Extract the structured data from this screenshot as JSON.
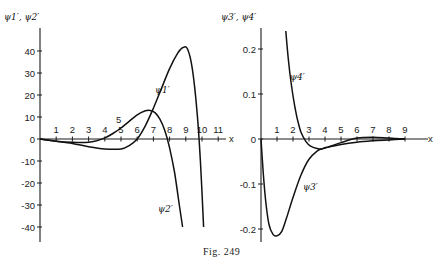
{
  "caption": "Fig. 249",
  "chart_data": [
    {
      "type": "line",
      "title": "",
      "ylabel": "ψ1′, ψ2′",
      "xlabel": "x",
      "xlim": [
        0,
        11
      ],
      "ylim": [
        -45,
        45
      ],
      "x_ticks": [
        1,
        2,
        3,
        4,
        5,
        6,
        7,
        8,
        9,
        10,
        11
      ],
      "x_tick_labels": [
        "1",
        "2",
        "3",
        "4",
        "5",
        "6",
        "7",
        "8",
        "9",
        "10",
        "11"
      ],
      "y_ticks": [
        -40,
        -30,
        -20,
        -10,
        0,
        10,
        20,
        30,
        40
      ],
      "y_tick_labels": [
        "-40",
        "-30",
        "-20",
        "-10",
        "0",
        "10",
        "20",
        "30",
        "40"
      ],
      "grid": false,
      "series": [
        {
          "name": "ψ1′",
          "x": [
            0,
            1,
            2,
            3,
            4,
            5,
            5.5,
            6,
            6.5,
            7,
            7.5,
            8,
            8.5,
            8.8,
            9.1,
            9.4,
            9.7,
            9.9,
            10.1
          ],
          "y": [
            0,
            -1,
            -2,
            -3.5,
            -4.5,
            -4.5,
            -3,
            0,
            6,
            14,
            23,
            32,
            39,
            41.5,
            41,
            32,
            12,
            -10,
            -40
          ]
        },
        {
          "name": "ψ2′",
          "x": [
            0,
            1,
            2,
            3,
            3.5,
            4,
            4.5,
            5,
            5.5,
            6,
            6.5,
            6.8,
            7.1,
            7.4,
            7.7,
            8,
            8.3,
            8.6,
            8.8
          ],
          "y": [
            0,
            -1,
            -1.5,
            -1.5,
            -0.8,
            0.5,
            2.5,
            5,
            8,
            11,
            12.8,
            13,
            12,
            9,
            4,
            -4,
            -15,
            -30,
            -40
          ]
        }
      ],
      "annotations": [
        "ψ1′",
        "ψ2′",
        "5",
        "x"
      ]
    },
    {
      "type": "line",
      "title": "",
      "ylabel": "ψ3′, ψ4′",
      "xlabel": "x",
      "xlim": [
        0,
        9.5
      ],
      "ylim": [
        -0.22,
        0.24
      ],
      "x_ticks": [
        1,
        2,
        3,
        4,
        5,
        6,
        7,
        8,
        9
      ],
      "x_tick_labels": [
        "1",
        "2",
        "3",
        "4",
        "5",
        "6",
        "7",
        "8",
        "9"
      ],
      "y_ticks": [
        -0.2,
        -0.1,
        0,
        0.1,
        0.2
      ],
      "y_tick_labels": [
        "-0.2",
        "-0.1",
        "0",
        "0.1",
        "0.2"
      ],
      "grid": false,
      "series": [
        {
          "name": "ψ3′",
          "x": [
            0,
            0.15,
            0.3,
            0.5,
            0.75,
            1.0,
            1.3,
            1.6,
            2.0,
            2.5,
            3.0,
            3.5,
            3.8,
            4.2,
            5,
            6,
            7,
            8,
            9
          ],
          "y": [
            0,
            -0.08,
            -0.14,
            -0.19,
            -0.212,
            -0.215,
            -0.205,
            -0.175,
            -0.13,
            -0.08,
            -0.045,
            -0.027,
            -0.022,
            -0.018,
            -0.012,
            -0.007,
            -0.004,
            -0.002,
            0
          ]
        },
        {
          "name": "ψ4′",
          "x": [
            1.55,
            1.7,
            1.9,
            2.1,
            2.3,
            2.5,
            2.8,
            3.1,
            3.5,
            3.8,
            4.2,
            5,
            6,
            7,
            8,
            9
          ],
          "y": [
            0.24,
            0.18,
            0.12,
            0.075,
            0.04,
            0.015,
            -0.005,
            -0.016,
            -0.021,
            -0.022,
            -0.018,
            -0.008,
            0.002,
            0.004,
            0.002,
            0
          ]
        }
      ],
      "annotations": [
        "ψ3′",
        "ψ4′",
        "x"
      ]
    }
  ]
}
